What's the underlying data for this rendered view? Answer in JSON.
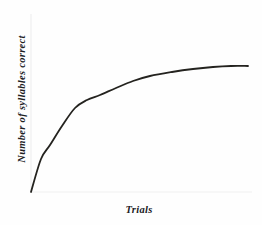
{
  "figure": {
    "background_color": "#fefefe",
    "curve_color": "#24231f",
    "axis_color": "#ececed"
  },
  "chart_data": {
    "type": "line",
    "title": "",
    "subtitle": "",
    "xlabel": "Trials",
    "ylabel": "Number of syllables correct",
    "legend": [],
    "legend_position": "none",
    "grid": false,
    "xticks": [],
    "yticks": [],
    "xtick_labels": [],
    "ytick_labels": [],
    "xlim": [
      0,
      1
    ],
    "ylim": [
      0,
      1
    ],
    "annotations": [],
    "series": [
      {
        "name": "learning curve",
        "color": "#24231f",
        "line_width": 1.8,
        "x": [
          0.0,
          0.05,
          0.09,
          0.14,
          0.2,
          0.25,
          0.32,
          0.39,
          0.46,
          0.55,
          0.64,
          0.73,
          0.82,
          0.91,
          1.0
        ],
        "y": [
          0.0,
          0.26,
          0.39,
          0.5,
          0.6,
          0.67,
          0.74,
          0.79,
          0.83,
          0.87,
          0.9,
          0.93,
          0.95,
          0.97,
          1.0
        ]
      }
    ],
    "pixel_path_points": [
      [
        31,
        192
      ],
      [
        41,
        159
      ],
      [
        50,
        145
      ],
      [
        62,
        126
      ],
      [
        75,
        108
      ],
      [
        87,
        100
      ],
      [
        100,
        95
      ],
      [
        116,
        88
      ],
      [
        133,
        81
      ],
      [
        150,
        76
      ],
      [
        172,
        72
      ],
      [
        193,
        69
      ],
      [
        213,
        67
      ],
      [
        231,
        66
      ],
      [
        248,
        66
      ]
    ],
    "axes_pixels": {
      "x_axis": {
        "x1": 31,
        "y1": 192,
        "x2": 252,
        "y2": 192
      },
      "y_axis": {
        "x1": 31,
        "y1": 14,
        "x2": 31,
        "y2": 192
      }
    }
  }
}
